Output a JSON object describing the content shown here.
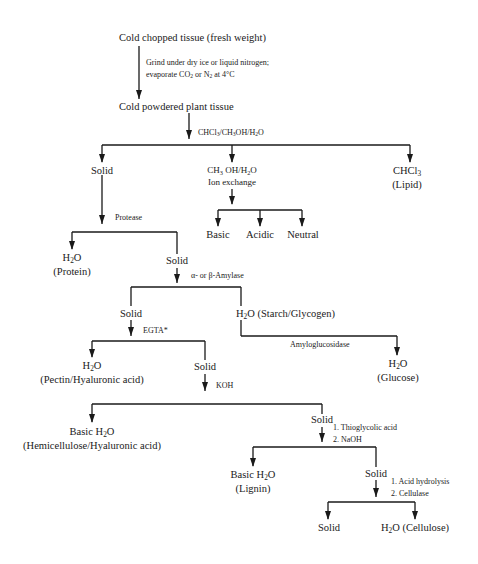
{
  "diagram": {
    "type": "flowchart",
    "nodes": {
      "start": "Cold chopped tissue (fresh weight)",
      "powder": "Cold powdered plant tissue",
      "solid1": "Solid",
      "methanol_phase_line1": "CH3 OH/H2O",
      "methanol_phase_line2": "Ion exchange",
      "chcl3_line1": "CHCl3",
      "chcl3_line2": "(Lipid)",
      "basic": "Basic",
      "acidic": "Acidic",
      "neutral": "Neutral",
      "protein_line1": "H2O",
      "protein_line2": "(Protein)",
      "solid2": "Solid",
      "solid3": "Solid",
      "starch": "H2O (Starch/Glycogen)",
      "glucose_line1": "H2O",
      "glucose_line2": "(Glucose)",
      "pectin_line1": "H2O",
      "pectin_line2": "(Pectin/Hyaluronic acid)",
      "solid4": "Solid",
      "hemi_line1": "Basic H2O",
      "hemi_line2": "(Hemicellulose/Hyaluronic acid)",
      "solid5": "Solid",
      "lignin_line1": "Basic H2O",
      "lignin_line2": "(Lignin)",
      "solid6": "Solid",
      "solid_final": "Solid",
      "cellulose": "H2O (Cellulose)"
    },
    "reagents": {
      "grind_line1": "Grind under dry ice or liquid nitrogen;",
      "grind_line2": "evaporate CO2 or N2 at 4°C",
      "extraction": "CHCl3/CH3OH/H2O",
      "protease": "Protease",
      "amylase": "α- or β-Amylase",
      "amyloglucosidase": "Amyloglucosidase",
      "egta": "EGTA*",
      "koh": "KOH",
      "thio_line1": "1. Thioglycolic acid",
      "thio_line2": "2. NaOH",
      "acid_line1": "1. Acid hydrolysis",
      "acid_line2": "2. Cellulase"
    }
  }
}
